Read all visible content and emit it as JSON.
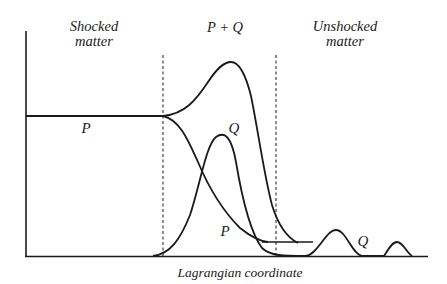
{
  "regions": {
    "shocked": {
      "line1": "Shocked",
      "line2": "matter"
    },
    "mixed": {
      "label": "P + Q"
    },
    "unshocked": {
      "line1": "Unshocked",
      "line2": "matter"
    }
  },
  "curve_labels": {
    "p_plateau": "P",
    "q_peak": "Q",
    "p_tail": "P",
    "q_waves": "Q"
  },
  "axis": {
    "xlabel": "Lagrangian coordinate"
  },
  "colors": {
    "ink": "#1a1a1a",
    "background": "#ffffff"
  }
}
